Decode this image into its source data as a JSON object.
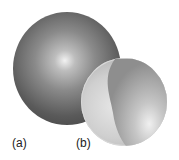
{
  "figure": {
    "panels": [
      {
        "label": "(a)",
        "description": "solid dark sphere with central highlight"
      },
      {
        "label": "(b)",
        "description": "light sphere with curved internal shaded region"
      }
    ],
    "colors": {
      "sphere_a_dark": "#3a3a3a",
      "sphere_a_highlight": "#f2f2f2",
      "sphere_b_light": "#e6e6e6",
      "sphere_b_shade": "#9a9a9a"
    }
  }
}
